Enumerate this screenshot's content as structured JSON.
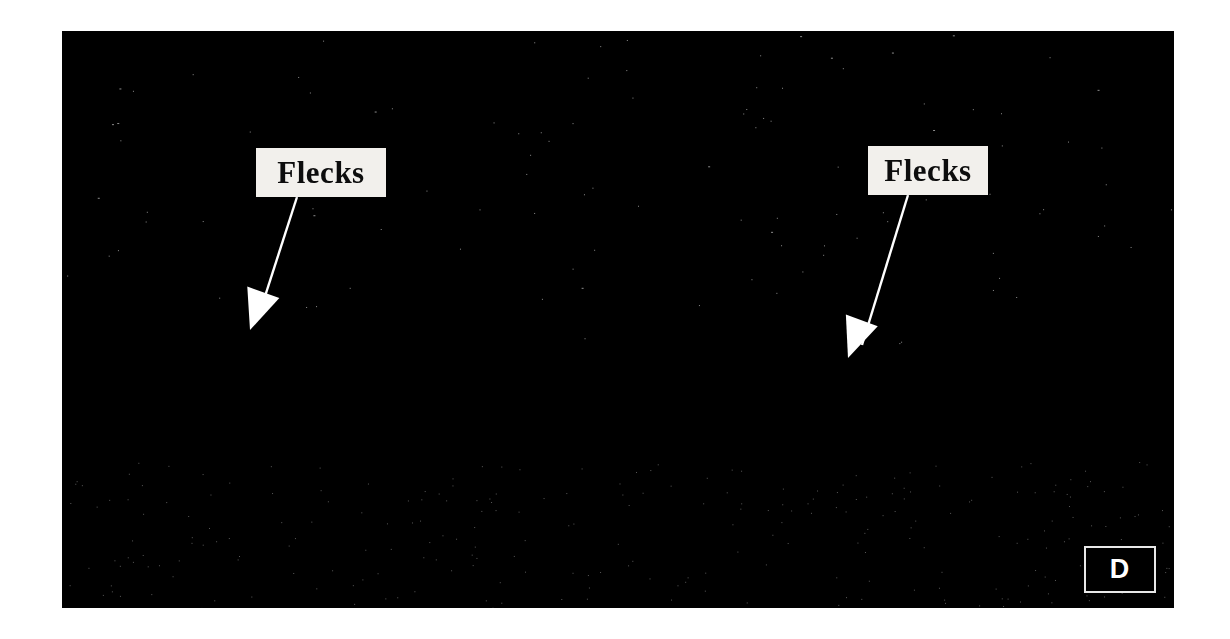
{
  "figure": {
    "modality": "OCT B-scan",
    "panel_letter": "D",
    "background_color": "#ffffff",
    "scan_background_color": "#000000"
  },
  "annotations": [
    {
      "id": "flecks-left",
      "label": "Flecks",
      "box": {
        "x": 256,
        "y": 148,
        "w": 130,
        "h": 49
      },
      "leader_start": {
        "x": 297,
        "y": 197
      },
      "leader_end": {
        "x": 258,
        "y": 318
      },
      "arrow_tip": {
        "x": 250,
        "y": 330
      },
      "color": "#ffffff"
    },
    {
      "id": "flecks-right",
      "label": "Flecks",
      "box": {
        "x": 868,
        "y": 146,
        "w": 120,
        "h": 49
      },
      "leader_start": {
        "x": 908,
        "y": 195
      },
      "leader_end": {
        "x": 862,
        "y": 345
      },
      "arrow_tip": {
        "x": 848,
        "y": 358
      },
      "color": "#ffffff"
    }
  ],
  "panel": {
    "letter": "D",
    "border_color": "#e8e8e8",
    "text_color": "#ffffff"
  },
  "chart_data": {
    "type": "line",
    "xlabel": "",
    "ylabel": "",
    "x": [
      0,
      60,
      120,
      180,
      240,
      300,
      360,
      420,
      480,
      520,
      556,
      600,
      660,
      720,
      780,
      840,
      900,
      960,
      1020,
      1080,
      1112
    ],
    "series": [
      {
        "name": "inner-retinal-surface",
        "values": [
          262,
          268,
          272,
          280,
          292,
          306,
          322,
          340,
          362,
          382,
          392,
          380,
          330,
          300,
          282,
          268,
          256,
          244,
          236,
          230,
          228
        ]
      },
      {
        "name": "rpe-band",
        "values": [
          356,
          362,
          368,
          376,
          388,
          400,
          414,
          428,
          440,
          450,
          454,
          450,
          434,
          418,
          404,
          392,
          380,
          368,
          358,
          350,
          346
        ]
      },
      {
        "name": "outer-boundary",
        "values": [
          408,
          414,
          420,
          428,
          440,
          452,
          466,
          480,
          492,
          502,
          506,
          502,
          488,
          472,
          458,
          446,
          434,
          422,
          412,
          404,
          400
        ]
      }
    ],
    "ylim": [
      0,
      577
    ],
    "xlim": [
      0,
      1112
    ],
    "grid": false,
    "legend": "none"
  }
}
